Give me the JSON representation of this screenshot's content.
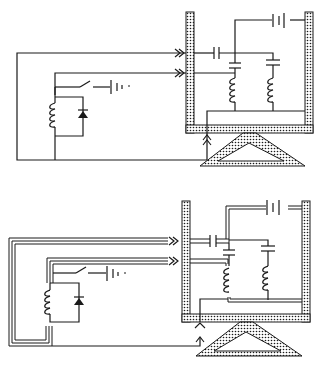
{
  "figure": {
    "description": "Two schematic diagrams of a resonant tuned-circuit apparatus inside a shielded (stippled) enclosure resting on a triangular stand, driven by a coil/diode/switch/battery circuit. Top: single-wire connections. Bottom: same circuit with shielded multi-conductor cables.",
    "colors": {
      "ink": "#1a1a1a",
      "background": "#ffffff",
      "stipple": "#ffffff"
    }
  },
  "panels": [
    {
      "id": "top",
      "label": "single-wire version",
      "components": [
        "coil",
        "diode",
        "switch",
        "battery",
        "enclosure-battery",
        "coupling-capacitor",
        "lc-tank-1",
        "lc-tank-2",
        "shielded-enclosure",
        "triangular-stand",
        "feedthrough-connectors"
      ]
    },
    {
      "id": "bottom",
      "label": "shielded-cable version",
      "components": [
        "coil",
        "diode",
        "switch",
        "battery",
        "enclosure-battery",
        "coupling-capacitor",
        "lc-tank-1",
        "lc-tank-2",
        "shielded-enclosure",
        "triangular-stand",
        "feedthrough-connectors",
        "shielded-cables"
      ]
    }
  ],
  "icons": {
    "battery": "battery-icon",
    "capacitor": "capacitor-icon",
    "inductor": "coil-icon",
    "diode": "diode-icon",
    "switch": "switch-icon",
    "connector": "double-chevron-icon"
  }
}
